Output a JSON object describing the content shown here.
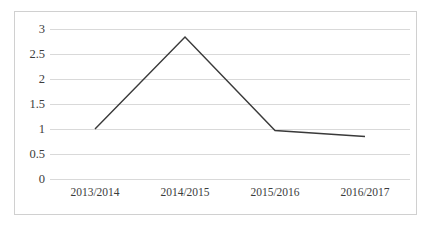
{
  "chart_data": {
    "type": "line",
    "title": "",
    "xlabel": "",
    "ylabel": "",
    "categories": [
      "2013/2014",
      "2014/2015",
      "2015/2016",
      "2016/2017"
    ],
    "values": [
      1.0,
      2.84,
      0.97,
      0.85
    ],
    "series": [
      {
        "name": "",
        "values": [
          1.0,
          2.84,
          0.97,
          0.85
        ]
      }
    ],
    "ylim": [
      0,
      3
    ],
    "yticks": [
      0,
      0.5,
      1,
      1.5,
      2,
      2.5,
      3
    ],
    "ytick_labels": [
      "0",
      "0.5",
      "1",
      "1.5",
      "2",
      "2.5",
      "3"
    ],
    "grid": true,
    "grid_axis": "y",
    "legend": false,
    "legend_position": "none",
    "markers": false,
    "line_color": "#3a3a3a",
    "grid_color": "#d9d9d9",
    "frame_color": "#d0d0d0",
    "background_color": "#ffffff"
  },
  "axes": {
    "y_title": "",
    "x_title": ""
  }
}
